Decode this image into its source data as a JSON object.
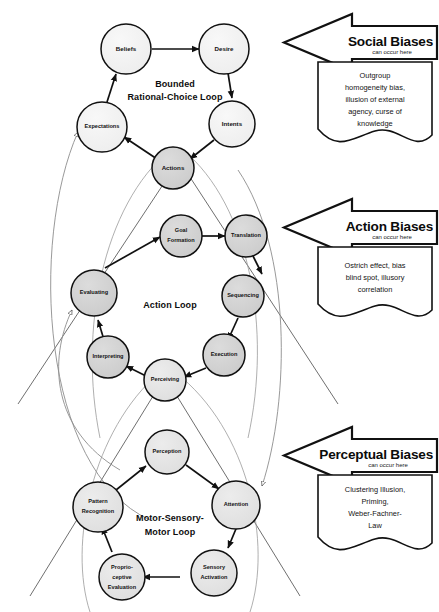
{
  "diagram": {
    "title_hidden": "",
    "loops": [
      {
        "id": "bounded-rational-choice-loop",
        "title_line1": "Bounded",
        "title_line2": "Rational-Choice Loop",
        "nodes": [
          {
            "id": "beliefs",
            "label": "Beliefs",
            "shade": "light"
          },
          {
            "id": "desire",
            "label": "Desire",
            "shade": "light"
          },
          {
            "id": "intents",
            "label": "Intents",
            "shade": "light"
          },
          {
            "id": "actions",
            "label": "Actions",
            "shade": "mid"
          },
          {
            "id": "expectations",
            "label": "Expectations",
            "shade": "light"
          }
        ]
      },
      {
        "id": "action-loop",
        "title_line1": "Action Loop",
        "title_line2": "",
        "nodes": [
          {
            "id": "goal-formation",
            "label_line1": "Goal",
            "label_line2": "Formation",
            "shade": "mid"
          },
          {
            "id": "translation",
            "label": "Translation",
            "shade": "mid"
          },
          {
            "id": "sequencing",
            "label": "Sequencing",
            "shade": "mid"
          },
          {
            "id": "execution",
            "label": "Execution",
            "shade": "mid"
          },
          {
            "id": "perceiving",
            "label": "Perceiving",
            "shade": "light2"
          },
          {
            "id": "interpreting",
            "label": "Interpreting",
            "shade": "mid"
          },
          {
            "id": "evaluating",
            "label": "Evaluating",
            "shade": "mid"
          }
        ]
      },
      {
        "id": "motor-sensory-motor-loop",
        "title_line1": "Motor-Sensory-",
        "title_line2": "Motor Loop",
        "nodes": [
          {
            "id": "perception",
            "label": "Perception",
            "shade": "light2"
          },
          {
            "id": "attention",
            "label": "Attention",
            "shade": "light2"
          },
          {
            "id": "sensory-activation",
            "label_line1": "Sensory",
            "label_line2": "Activation",
            "shade": "light2"
          },
          {
            "id": "proprioceptive-evaluation",
            "label_line1": "Proprio-",
            "label_line2": "ceptive",
            "label_line3": "Evaluation",
            "shade": "light2"
          },
          {
            "id": "pattern-recognition",
            "label_line1": "Pattern",
            "label_line2": "Recognition",
            "shade": "light2"
          }
        ]
      }
    ],
    "banners": [
      {
        "id": "social-biases",
        "title": "Social Biases",
        "subtitle": "can occur here",
        "note": [
          "Outgroup",
          "homogeneity bias,",
          "illusion of external",
          "agency, curse of",
          "knowledge"
        ]
      },
      {
        "id": "action-biases",
        "title": "Action Biases",
        "subtitle": "can occur here",
        "note": [
          "Ostrich effect, bias",
          "blind spot, illusory",
          "correlation"
        ]
      },
      {
        "id": "perceptual-biases",
        "title": "Perceptual Biases",
        "subtitle": "can occur here",
        "note": [
          "Clustering Illusion,",
          "Priming,",
          "Weber-Fachner-",
          "Law"
        ]
      }
    ],
    "colors": {
      "node_light": "#f0f0f0",
      "node_light2": "#e4e4e4",
      "node_mid": "#d2d2d2",
      "stroke": "#111111",
      "thin_line": "#8d8d8d",
      "background": "#ffffff"
    }
  }
}
